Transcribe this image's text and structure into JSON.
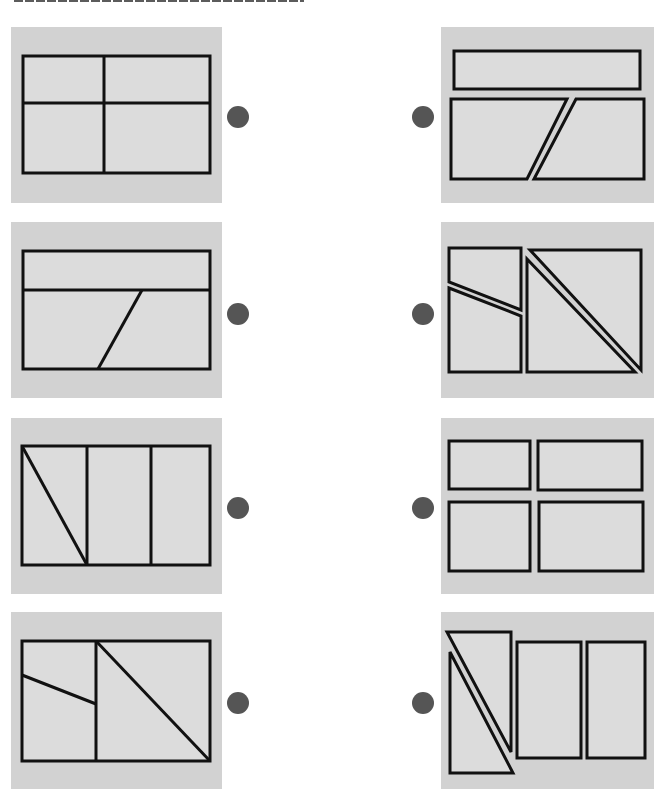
{
  "worksheet": {
    "instruction_heading": "",
    "panel_fill": "#d2d2d2",
    "shape_fill": "#dcdcdc",
    "line_color": "#111111",
    "dot_color": "#555555"
  },
  "left_column": [
    {
      "id": "L1",
      "description": "rectangle divided into four parts by one vertical and one horizontal line"
    },
    {
      "id": "L2",
      "description": "rectangle divided by a horizontal line, lower part split by a slanted line"
    },
    {
      "id": "L3",
      "description": "rectangle divided into three vertical strips, leftmost split by a diagonal"
    },
    {
      "id": "L4",
      "description": "rectangle split vertically; left part cut by a slanted line, right part cut by a diagonal"
    }
  ],
  "right_column": [
    {
      "id": "R1",
      "description": "pieces: one long rectangle, two trapezoids"
    },
    {
      "id": "R2",
      "description": "pieces: two quadrilaterals, two right triangles"
    },
    {
      "id": "R3",
      "description": "pieces: four separate rectangles"
    },
    {
      "id": "R4",
      "description": "pieces: two right triangles, two rectangles"
    }
  ]
}
